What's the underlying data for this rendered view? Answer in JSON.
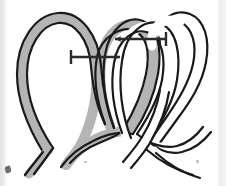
{
  "figure": {
    "caption": "",
    "background_color": "#ffffff",
    "stroke_color": "#1a1a1a",
    "shaded_strand_fill": "#b4b4b4",
    "unshaded_strand_fill": "#ffffff",
    "arrow_color": "#2b2b2b",
    "width": 226,
    "height": 186
  },
  "strands": [
    {
      "id": "shaded-strand",
      "label": "Shaded rope strand",
      "fill": "#b4b4b4",
      "outline": "#1a1a1a",
      "description": "Left loop and middle loop, tail exits lower left"
    },
    {
      "id": "unshaded-strand",
      "label": "Unshaded rope strand",
      "fill": "#ffffff",
      "outline": "#1a1a1a",
      "description": "Middle loop and right loop, tail exits lower right"
    }
  ],
  "arrows": [
    {
      "id": "arrow-lower",
      "label": "Lower motion arrow",
      "direction": "right",
      "x1": 71,
      "y1": 57,
      "x2": 122,
      "y2": 57,
      "color": "#2b2b2b"
    },
    {
      "id": "arrow-upper",
      "label": "Upper motion arrow",
      "direction": "left",
      "x1": 166,
      "y1": 39,
      "x2": 112,
      "y2": 39,
      "color": "#2b2b2b"
    }
  ],
  "artifacts": {
    "left_edge_label": "scan edge shading",
    "right_edge_label": "scan edge shading",
    "speck_label": "scan speck"
  }
}
